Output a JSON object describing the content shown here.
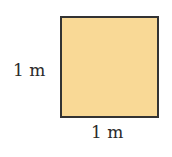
{
  "figure": {
    "shape": "square",
    "fill_color": "#f9d996",
    "stroke_color": "#333333",
    "labels": {
      "left_side": "1 m",
      "bottom_side": "1 m"
    }
  }
}
